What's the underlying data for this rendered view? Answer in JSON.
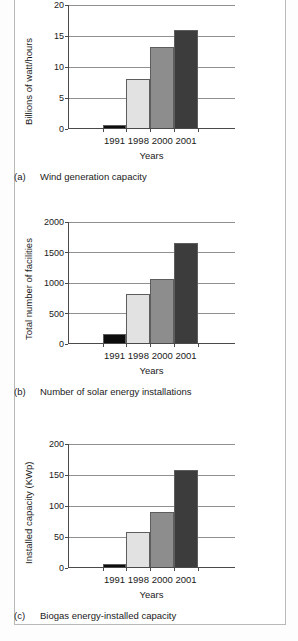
{
  "figure": {
    "categories": [
      "1991",
      "1998",
      "2000",
      "2001"
    ],
    "series_colors": {
      "1991": "#0d0d0d",
      "1998": "#e2e2e2",
      "2000": "#8d8d8d",
      "2001": "#3c3c3c"
    },
    "grid_color": "#909090",
    "axis_color": "#4a4a4a"
  },
  "chart_data": [
    {
      "type": "bar",
      "id": "a",
      "caption_tag": "(a)",
      "caption_text": "Wind generation capacity",
      "title": "",
      "xlabel": "Years",
      "ylabel": "Billions of watt/hours",
      "categories": [
        "1991",
        "1998",
        "2000",
        "2001"
      ],
      "values": [
        0.7,
        8.1,
        13.3,
        15.9
      ],
      "yticks": [
        0,
        5,
        10,
        15,
        20
      ],
      "ylim": [
        0,
        20
      ],
      "grid": true,
      "legend": "none"
    },
    {
      "type": "bar",
      "id": "b",
      "caption_tag": "(b)",
      "caption_text": "Number of solar energy installations",
      "title": "",
      "xlabel": "Years",
      "ylabel": "Total number of facilities",
      "categories": [
        "1991",
        "1998",
        "2000",
        "2001"
      ],
      "values": [
        170,
        820,
        1070,
        1650
      ],
      "yticks": [
        0,
        500,
        1000,
        1500,
        2000
      ],
      "ylim": [
        0,
        2000
      ],
      "grid": true,
      "legend": "none"
    },
    {
      "type": "bar",
      "id": "c",
      "caption_tag": "(c)",
      "caption_text": "Biogas energy-installed capacity",
      "title": "",
      "xlabel": "Years",
      "ylabel": "Installed capacity (KWp)",
      "categories": [
        "1991",
        "1998",
        "2000",
        "2001"
      ],
      "values": [
        6,
        58,
        90,
        158
      ],
      "yticks": [
        0,
        50,
        100,
        150,
        200
      ],
      "ylim": [
        0,
        200
      ],
      "grid": true,
      "legend": "none"
    }
  ]
}
